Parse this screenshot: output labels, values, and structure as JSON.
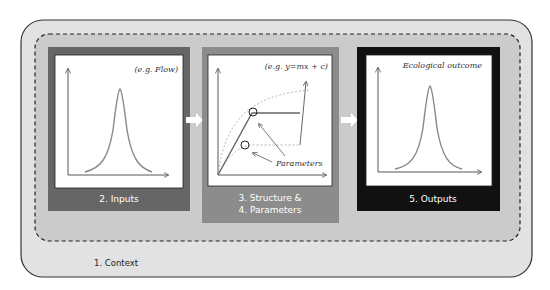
{
  "context": {
    "label": "1. Context"
  },
  "panels": [
    {
      "id": "inputs",
      "label": "2. Inputs",
      "annotation": "(e.g. Flow)",
      "color": "#666666"
    },
    {
      "id": "structure",
      "label_line1": "3. Structure &",
      "label_line2": "4. Parameters",
      "annotation": "(e.g. y=mx + c)",
      "callout": "Parameters",
      "color": "#8c8c8c"
    },
    {
      "id": "outputs",
      "label": "5. Outputs",
      "annotation": "Ecological outcome",
      "color": "#111111"
    }
  ],
  "colors": {
    "outer_fill": "#e2e2e2",
    "dashed_fill": "#cbcbcb",
    "curve": "#888888",
    "axis": "#444444"
  }
}
